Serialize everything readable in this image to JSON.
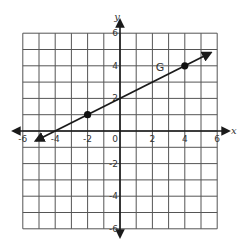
{
  "chart_data": {
    "type": "line",
    "title": "",
    "xlabel": "x",
    "ylabel": "y",
    "xlim": [
      -6,
      6
    ],
    "ylim": [
      -6,
      6
    ],
    "grid": true,
    "grid_step": 1,
    "x_ticks": [
      -6,
      -4,
      -2,
      0,
      2,
      4,
      6
    ],
    "y_ticks": [
      -6,
      -4,
      -2,
      2,
      4,
      6
    ],
    "x_tick_labels": [
      "-6",
      "-4",
      "-2",
      "0",
      "2",
      "4",
      "6"
    ],
    "y_tick_labels": [
      "-6",
      "-4",
      "-2",
      "2",
      "4",
      "6"
    ],
    "series": [
      {
        "name": "G",
        "kind": "line-with-arrows",
        "equation": "y = 0.5x + 2",
        "slope": 0.5,
        "intercept": 2,
        "x_range": [
          -5.2,
          5.6
        ],
        "points": [
          {
            "x": -2,
            "y": 1
          },
          {
            "x": 4,
            "y": 4
          }
        ],
        "label": "G",
        "label_position": {
          "x": 2.2,
          "y": 3.7
        }
      }
    ],
    "colors": {
      "grid": "#555555",
      "axis": "#1a1a1a",
      "line": "#1a1a1a",
      "point": "#111111",
      "text": "#333333"
    }
  }
}
